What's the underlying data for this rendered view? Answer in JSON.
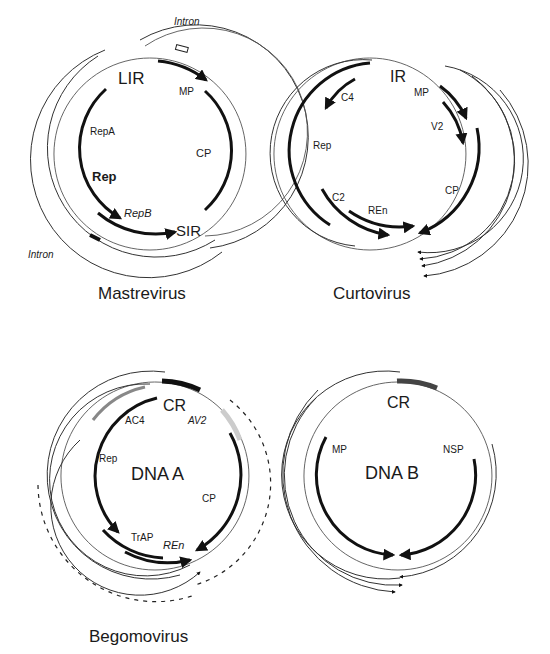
{
  "figure": {
    "panels": [
      {
        "name": "Mastrevirus",
        "caption": "Mastrevirus",
        "regions": [
          "LIR",
          "SIR"
        ],
        "genes": [
          "MP",
          "CP",
          "RepA",
          "Rep",
          "RepB"
        ],
        "annotations": [
          "Intron",
          "Intron"
        ]
      },
      {
        "name": "Curtovirus",
        "caption": "Curtovirus",
        "regions": [
          "IR"
        ],
        "genes": [
          "MP",
          "V2",
          "CP",
          "C4",
          "Rep",
          "C2",
          "REn"
        ]
      },
      {
        "name": "Begomovirus DNA A",
        "center_label": "DNA A",
        "regions": [
          "CR"
        ],
        "genes": [
          "AC4",
          "AV2",
          "Rep",
          "CP",
          "TrAP",
          "REn"
        ]
      },
      {
        "name": "Begomovirus DNA B",
        "center_label": "DNA B",
        "regions": [
          "CR"
        ],
        "genes": [
          "MP",
          "NSP"
        ]
      }
    ],
    "captions": {
      "mastrevirus": "Mastrevirus",
      "curtovirus": "Curtovirus",
      "begomovirus": "Begomovirus"
    },
    "labels": {
      "mast_intron_top": "Intron",
      "mast_intron_bottom": "Intron",
      "mast_lir": "LIR",
      "mast_sir": "SIR",
      "mast_mp": "MP",
      "mast_cp": "CP",
      "mast_repa": "RepA",
      "mast_rep": "Rep",
      "mast_repb": "RepB",
      "curt_ir": "IR",
      "curt_mp": "MP",
      "curt_v2": "V2",
      "curt_cp": "CP",
      "curt_c4": "C4",
      "curt_rep": "Rep",
      "curt_c2": "C2",
      "curt_ren": "REn",
      "bega_cr": "CR",
      "bega_center": "DNA A",
      "bega_ac4": "AC4",
      "bega_av2": "AV2",
      "bega_rep": "Rep",
      "bega_cp": "CP",
      "bega_trap": "TrAP",
      "bega_ren": "REn",
      "begb_cr": "CR",
      "begb_center": "DNA B",
      "begb_mp": "MP",
      "begb_nsp": "NSP"
    }
  }
}
